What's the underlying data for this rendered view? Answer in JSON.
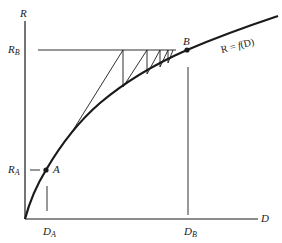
{
  "diagram": {
    "axes": {
      "y_label": "R",
      "x_label": "D"
    },
    "curve_label": {
      "lhs": "R",
      "equals": "=",
      "func": "f",
      "arg": "(D)"
    },
    "points": {
      "A": {
        "label": "A",
        "r_label_main": "R",
        "r_label_sub": "A",
        "d_label_main": "D",
        "d_label_sub": "A"
      },
      "B": {
        "label": "B",
        "r_label_main": "R",
        "r_label_sub": "B",
        "d_label_main": "D",
        "d_label_sub": "B"
      }
    },
    "colors": {
      "line": "#1a1a1a",
      "background": "#ffffff"
    }
  }
}
